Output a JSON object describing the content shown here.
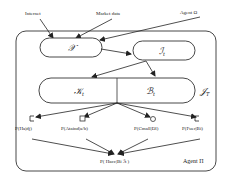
{
  "diagram": {
    "inputs": {
      "internet": "Internet",
      "market_data": "Market data",
      "agent_omega": "Agent Ω"
    },
    "nodes": {
      "x": "𝒳",
      "i_t": "ℐ",
      "i_t_sub": "t",
      "k_t": "𝒦",
      "k_t_sub": "t",
      "b_t": "ℬ",
      "b_t_sub": "t",
      "j_t": "𝒥",
      "j_t_sub": "T"
    },
    "outcomes": [
      {
        "label": "P(Ha|dj)",
        "marker": "square-open-left"
      },
      {
        "label": "P(Ataind|a/b)",
        "marker": "square"
      },
      {
        "label": "P(Cmall|Dl)",
        "marker": "circle"
      },
      {
        "label": "P(Fuer|Bi)",
        "marker": "square-open-left"
      }
    ],
    "final": {
      "label": "P( Hacc|Bi  ℐt )"
    },
    "agent_label": "Agent Π"
  }
}
